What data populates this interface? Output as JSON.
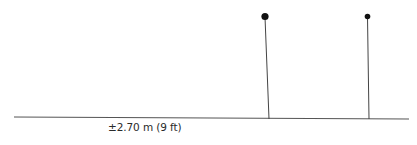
{
  "diagram": {
    "label": "±2.70 m (9 ft)",
    "colors": {
      "line": "#555555",
      "pole": "#444444",
      "knob": "#111111",
      "text": "#2a2a2a"
    },
    "ground": {
      "x1": 14,
      "y1": 117,
      "x2": 409,
      "y2": 119
    },
    "poles": [
      {
        "top_x": 265,
        "top_y": 17,
        "base_x": 269,
        "base_y": 119,
        "knob_r": 3.6
      },
      {
        "top_x": 367,
        "top_y": 17,
        "base_x": 369,
        "base_y": 119,
        "knob_r": 2.8
      }
    ]
  }
}
